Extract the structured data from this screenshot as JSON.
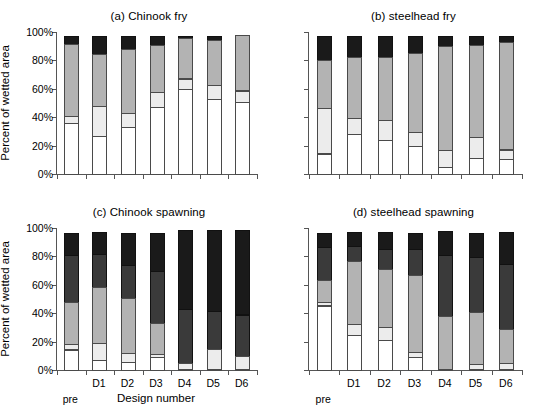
{
  "figure": {
    "width": 543,
    "height": 402,
    "background": "#ffffff",
    "axis_color": "#555555"
  },
  "axis": {
    "ylabel": "Percent of wetted area",
    "xlabel": "Design number",
    "yticks": [
      "0%",
      "20%",
      "40%",
      "60%",
      "80%",
      "100%"
    ],
    "ytick_values": [
      0,
      20,
      40,
      60,
      80,
      100
    ],
    "ylim": [
      0,
      100
    ],
    "xcategories": [
      "pre",
      "D1",
      "D2",
      "D3",
      "D4",
      "D5",
      "D6"
    ]
  },
  "series_colors": {
    "series1": "#ffffff",
    "series2": "#ececec",
    "series3": "#b3b3b3",
    "series4": "#1a1a1a"
  },
  "panels": {
    "a": {
      "title": "(a) Chinook fry"
    },
    "b": {
      "title": "(b) steelhead fry"
    },
    "c": {
      "title": "(c) Chinook spawning"
    },
    "d": {
      "title": "(d) steelhead spawning"
    }
  },
  "chart_data": [
    {
      "type": "bar",
      "stacked": true,
      "panel": "a",
      "title": "(a) Chinook fry",
      "xlabel": "",
      "ylabel": "Percent of wetted area",
      "ylim": [
        0,
        100
      ],
      "grid": false,
      "legend": "none",
      "categories": [
        "pre",
        "D1",
        "D2",
        "D3",
        "D4",
        "D5",
        "D6"
      ],
      "series": [
        {
          "name": "series1",
          "color": "#ffffff",
          "values": [
            36.5,
            27.5,
            33.5,
            47.5,
            60.5,
            53.5,
            51.5
          ]
        },
        {
          "name": "series2",
          "color": "#ececec",
          "values": [
            5.5,
            21.5,
            11.0,
            11.5,
            8.0,
            10.5,
            8.5
          ]
        },
        {
          "name": "series3",
          "color": "#b3b3b3",
          "values": [
            51.5,
            37.5,
            45.5,
            34.0,
            29.0,
            32.5,
            40.0
          ]
        },
        {
          "name": "series4",
          "color": "#1a1a1a",
          "values": [
            6.5,
            13.5,
            10.0,
            7.0,
            2.5,
            3.5,
            0.0
          ]
        }
      ]
    },
    {
      "type": "bar",
      "stacked": true,
      "panel": "b",
      "title": "(b) steelhead fry",
      "xlabel": "",
      "ylabel": "",
      "ylim": [
        0,
        100
      ],
      "grid": false,
      "legend": "none",
      "categories": [
        "pre",
        "D1",
        "D2",
        "D3",
        "D4",
        "D5",
        "D6"
      ],
      "series": [
        {
          "name": "series1",
          "color": "#ffffff",
          "values": [
            15.0,
            29.0,
            24.5,
            20.5,
            5.5,
            12.0,
            11.0
          ]
        },
        {
          "name": "series2",
          "color": "#ececec",
          "values": [
            33.0,
            11.5,
            15.0,
            10.5,
            12.5,
            15.0,
            7.5
          ]
        },
        {
          "name": "series3",
          "color": "#b3b3b3",
          "values": [
            34.0,
            43.5,
            45.0,
            56.0,
            74.0,
            65.5,
            76.5
          ]
        },
        {
          "name": "series4",
          "color": "#1a1a1a",
          "values": [
            18.0,
            16.0,
            15.5,
            13.0,
            8.0,
            7.5,
            5.0
          ]
        }
      ]
    },
    {
      "type": "bar",
      "stacked": true,
      "panel": "c",
      "title": "(c) Chinook spawning",
      "xlabel": "Design number",
      "ylabel": "Percent of wetted area",
      "ylim": [
        0,
        100
      ],
      "grid": false,
      "legend": "none",
      "categories": [
        "pre",
        "D1",
        "D2",
        "D3",
        "D4",
        "D5",
        "D6"
      ],
      "series": [
        {
          "name": "series1",
          "color": "#ffffff",
          "values": [
            15.0,
            7.5,
            6.5,
            9.5,
            0.5,
            0.5,
            0.5
          ]
        },
        {
          "name": "series2",
          "color": "#ececec",
          "values": [
            4.5,
            12.5,
            6.5,
            3.0,
            5.0,
            14.5,
            9.5
          ]
        },
        {
          "name": "series3",
          "color": "#b3b3b3",
          "values": [
            30.0,
            40.5,
            39.5,
            22.5,
            0.0,
            0.0,
            0.0
          ]
        },
        {
          "name": "series4",
          "color": "#3a3a3a",
          "values": [
            34.0,
            23.5,
            24.0,
            37.0,
            38.5,
            27.5,
            30.0
          ]
        },
        {
          "name": "series5",
          "color": "#1a1a1a",
          "values": [
            16.5,
            16.0,
            23.5,
            28.0,
            56.0,
            57.5,
            60.0
          ]
        }
      ]
    },
    {
      "type": "bar",
      "stacked": true,
      "panel": "d",
      "title": "(d) steelhead spawning",
      "xlabel": "",
      "ylabel": "",
      "ylim": [
        0,
        100
      ],
      "grid": false,
      "legend": "none",
      "categories": [
        "pre",
        "D1",
        "D2",
        "D3",
        "D4",
        "D5",
        "D6"
      ],
      "series": [
        {
          "name": "series1",
          "color": "#ffffff",
          "values": [
            46.0,
            25.0,
            22.0,
            9.5,
            1.0,
            1.5,
            1.5
          ]
        },
        {
          "name": "series2",
          "color": "#ececec",
          "values": [
            3.0,
            8.5,
            9.5,
            4.5,
            0.0,
            4.0,
            4.5
          ]
        },
        {
          "name": "series3",
          "color": "#b3b3b3",
          "values": [
            16.5,
            45.0,
            41.5,
            54.5,
            38.0,
            37.0,
            25.0
          ]
        },
        {
          "name": "series4",
          "color": "#3a3a3a",
          "values": [
            23.5,
            11.5,
            14.5,
            19.5,
            43.5,
            39.5,
            46.0
          ]
        },
        {
          "name": "series5",
          "color": "#1a1a1a",
          "values": [
            11.0,
            10.0,
            12.5,
            12.0,
            17.5,
            18.0,
            23.0
          ]
        }
      ]
    }
  ]
}
